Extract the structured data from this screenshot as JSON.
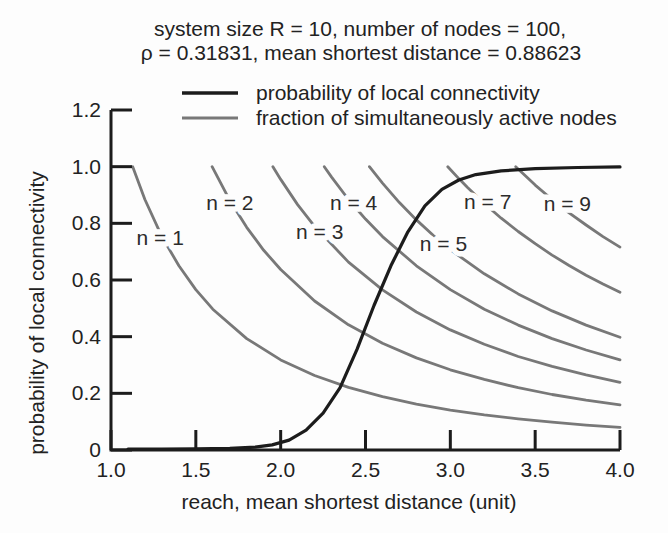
{
  "figure": {
    "title_line1": "system size R = 10, number of nodes = 100,",
    "title_line2": "ρ = 0.31831, mean shortest distance = 0.88623"
  },
  "legend": {
    "items": [
      {
        "label": "probability of local connectivity",
        "color": "#1c1c1c"
      },
      {
        "label": "fraction of simultaneously active nodes",
        "color": "#787878"
      }
    ]
  },
  "chart_data": {
    "type": "line",
    "title": "system size R = 10, number of nodes = 100, ρ = 0.31831, mean shortest distance = 0.88623",
    "xlabel": "reach, mean shortest distance (unit)",
    "ylabel": "probability of local connectivity",
    "xlim": [
      1.0,
      4.0
    ],
    "ylim": [
      0,
      1.2
    ],
    "x_ticks": [
      {
        "value": 1.0,
        "label": "1.0"
      },
      {
        "value": 1.5,
        "label": "1.5"
      },
      {
        "value": 2.0,
        "label": "2.0"
      },
      {
        "value": 2.5,
        "label": "2.5"
      },
      {
        "value": 3.0,
        "label": "3.0"
      },
      {
        "value": 3.5,
        "label": "3.5"
      },
      {
        "value": 4.0,
        "label": "4.0"
      }
    ],
    "y_ticks": [
      {
        "value": 0.0,
        "label": "0"
      },
      {
        "value": 0.2,
        "label": "0.2"
      },
      {
        "value": 0.4,
        "label": "0.4"
      },
      {
        "value": 0.6,
        "label": "0.6"
      },
      {
        "value": 0.8,
        "label": "0.8"
      },
      {
        "value": 1.0,
        "label": "1.0"
      },
      {
        "value": 1.2,
        "label": "1.2"
      }
    ],
    "grid": false,
    "legend_position": "top",
    "series": [
      {
        "name": "probability of local connectivity",
        "role": "main",
        "color": "#1c1c1c",
        "width": 3.2,
        "points": [
          [
            1.1,
            0.003
          ],
          [
            1.3,
            0.003
          ],
          [
            1.5,
            0.004
          ],
          [
            1.7,
            0.006
          ],
          [
            1.85,
            0.01
          ],
          [
            1.95,
            0.018
          ],
          [
            2.05,
            0.035
          ],
          [
            2.15,
            0.07
          ],
          [
            2.25,
            0.13
          ],
          [
            2.35,
            0.22
          ],
          [
            2.45,
            0.355
          ],
          [
            2.55,
            0.51
          ],
          [
            2.65,
            0.65
          ],
          [
            2.75,
            0.77
          ],
          [
            2.85,
            0.862
          ],
          [
            2.95,
            0.92
          ],
          [
            3.05,
            0.953
          ],
          [
            3.15,
            0.972
          ],
          [
            3.3,
            0.985
          ],
          [
            3.5,
            0.993
          ],
          [
            3.75,
            0.997
          ],
          [
            4.0,
            0.999
          ]
        ]
      },
      {
        "name": "fraction of simultaneously active nodes, n = 1",
        "role": "family",
        "n": 1,
        "label": "n = 1",
        "label_at": [
          1.29,
          0.75
        ],
        "color": "#787878",
        "width": 2.8,
        "points": [
          [
            1.128,
            1.0
          ],
          [
            1.2,
            0.884
          ],
          [
            1.3,
            0.753
          ],
          [
            1.4,
            0.65
          ],
          [
            1.5,
            0.566
          ],
          [
            1.6,
            0.497
          ],
          [
            1.8,
            0.393
          ],
          [
            2.0,
            0.318
          ],
          [
            2.2,
            0.263
          ],
          [
            2.4,
            0.221
          ],
          [
            2.6,
            0.188
          ],
          [
            2.8,
            0.162
          ],
          [
            3.0,
            0.141
          ],
          [
            3.2,
            0.124
          ],
          [
            3.4,
            0.11
          ],
          [
            3.6,
            0.098
          ],
          [
            3.8,
            0.088
          ],
          [
            4.0,
            0.08
          ]
        ]
      },
      {
        "name": "fraction of simultaneously active nodes, n = 2",
        "role": "family",
        "n": 2,
        "label": "n = 2",
        "label_at": [
          1.7,
          0.873
        ],
        "color": "#787878",
        "width": 2.8,
        "points": [
          [
            1.596,
            1.0
          ],
          [
            1.7,
            0.881
          ],
          [
            1.8,
            0.786
          ],
          [
            1.9,
            0.705
          ],
          [
            2.0,
            0.637
          ],
          [
            2.2,
            0.526
          ],
          [
            2.4,
            0.442
          ],
          [
            2.6,
            0.377
          ],
          [
            2.8,
            0.325
          ],
          [
            3.0,
            0.283
          ],
          [
            3.2,
            0.249
          ],
          [
            3.4,
            0.22
          ],
          [
            3.6,
            0.196
          ],
          [
            3.8,
            0.176
          ],
          [
            4.0,
            0.159
          ]
        ]
      },
      {
        "name": "fraction of simultaneously active nodes, n = 3",
        "role": "family",
        "n": 3,
        "label": "n = 3",
        "label_at": [
          2.23,
          0.77
        ],
        "color": "#787878",
        "width": 2.8,
        "points": [
          [
            1.954,
            1.0
          ],
          [
            2.0,
            0.955
          ],
          [
            2.1,
            0.866
          ],
          [
            2.2,
            0.789
          ],
          [
            2.4,
            0.663
          ],
          [
            2.6,
            0.565
          ],
          [
            2.8,
            0.487
          ],
          [
            3.0,
            0.424
          ],
          [
            3.2,
            0.373
          ],
          [
            3.4,
            0.33
          ],
          [
            3.6,
            0.295
          ],
          [
            3.8,
            0.265
          ],
          [
            4.0,
            0.239
          ]
        ]
      },
      {
        "name": "fraction of simultaneously active nodes, n = 4",
        "role": "family",
        "n": 4,
        "label": "n = 4",
        "label_at": [
          2.43,
          0.873
        ],
        "color": "#787878",
        "width": 2.8,
        "points": [
          [
            2.257,
            1.0
          ],
          [
            2.3,
            0.963
          ],
          [
            2.4,
            0.884
          ],
          [
            2.5,
            0.815
          ],
          [
            2.6,
            0.753
          ],
          [
            2.8,
            0.65
          ],
          [
            3.0,
            0.566
          ],
          [
            3.2,
            0.497
          ],
          [
            3.4,
            0.441
          ],
          [
            3.6,
            0.393
          ],
          [
            3.8,
            0.353
          ],
          [
            4.0,
            0.318
          ]
        ]
      },
      {
        "name": "fraction of simultaneously active nodes, n = 5",
        "role": "family",
        "n": 5,
        "label": "n = 5",
        "label_at": [
          2.96,
          0.728
        ],
        "color": "#787878",
        "width": 2.8,
        "points": [
          [
            2.523,
            1.0
          ],
          [
            2.6,
            0.942
          ],
          [
            2.7,
            0.873
          ],
          [
            2.8,
            0.812
          ],
          [
            2.9,
            0.757
          ],
          [
            3.0,
            0.707
          ],
          [
            3.2,
            0.622
          ],
          [
            3.4,
            0.551
          ],
          [
            3.6,
            0.491
          ],
          [
            3.8,
            0.441
          ],
          [
            4.0,
            0.398
          ]
        ]
      },
      {
        "name": "fraction of simultaneously active nodes, n = 7",
        "role": "family",
        "n": 7,
        "label": "n = 7",
        "label_at": [
          3.22,
          0.876
        ],
        "color": "#787878",
        "width": 2.8,
        "points": [
          [
            2.985,
            1.0
          ],
          [
            3.05,
            0.958
          ],
          [
            3.1,
            0.927
          ],
          [
            3.2,
            0.87
          ],
          [
            3.3,
            0.818
          ],
          [
            3.4,
            0.771
          ],
          [
            3.5,
            0.728
          ],
          [
            3.6,
            0.688
          ],
          [
            3.7,
            0.651
          ],
          [
            3.8,
            0.617
          ],
          [
            3.9,
            0.586
          ],
          [
            4.0,
            0.557
          ]
        ]
      },
      {
        "name": "fraction of simultaneously active nodes, n = 9",
        "role": "family",
        "n": 9,
        "label": "n = 9",
        "label_at": [
          3.69,
          0.869
        ],
        "color": "#787878",
        "width": 2.8,
        "points": [
          [
            3.385,
            1.0
          ],
          [
            3.45,
            0.963
          ],
          [
            3.5,
            0.935
          ],
          [
            3.6,
            0.884
          ],
          [
            3.7,
            0.837
          ],
          [
            3.8,
            0.794
          ],
          [
            3.9,
            0.753
          ],
          [
            4.0,
            0.716
          ]
        ]
      }
    ]
  }
}
